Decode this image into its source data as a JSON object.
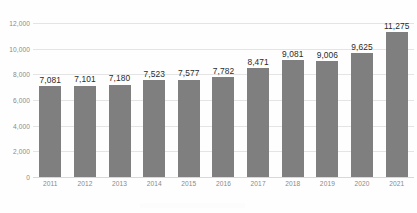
{
  "chart_data": {
    "type": "bar",
    "title": "",
    "subtitle": "",
    "xlabel": "",
    "ylabel": "",
    "categories": [
      "2011",
      "2012",
      "2013",
      "2014",
      "2015",
      "2016",
      "2017",
      "2018",
      "2019",
      "2020",
      "2021"
    ],
    "values": [
      7081,
      7101,
      7180,
      7523,
      7577,
      7782,
      8471,
      9081,
      9006,
      9625,
      11275
    ],
    "value_labels": [
      "7,081",
      "7,101",
      "7,180",
      "7,523",
      "7,577",
      "7,782",
      "8,471",
      "9,081",
      "9,006",
      "9,625",
      "11,275"
    ],
    "series": [
      {
        "name": "",
        "values": [
          7081,
          7101,
          7180,
          7523,
          7577,
          7782,
          8471,
          9081,
          9006,
          9625,
          11275
        ]
      }
    ],
    "ylim": [
      0,
      12000
    ],
    "ytick_values": [
      12000,
      10000,
      8000,
      6000,
      4000,
      2000,
      0
    ],
    "ytick_labels": [
      "12,000",
      "10,000",
      "8,000",
      "6,000",
      "4,000",
      "2,000",
      "0"
    ],
    "grid": "horizontal",
    "legend": "none",
    "bar_color": "#7f7f7f",
    "gridline_color": "#e4e4e4",
    "background_color": "#fefefe",
    "axis_label_color": "#8a8a8a",
    "data_label_color": "#2b2b2b"
  }
}
